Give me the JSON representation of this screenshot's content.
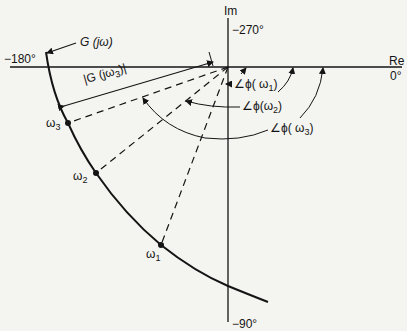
{
  "diagram": {
    "type": "polar-plot",
    "axes": {
      "imag_label": "Im",
      "real_label": "Re",
      "angle_top": "−270°",
      "angle_left": "−180°",
      "angle_right": "0°",
      "angle_bottom": "−90°"
    },
    "curve_label": "G (jω)",
    "magnitude_label": "|G (jω",
    "magnitude_sub": "3",
    "magnitude_tail": ")|",
    "points": [
      {
        "label": "ω",
        "sub": "1"
      },
      {
        "label": "ω",
        "sub": "2"
      },
      {
        "label": "ω",
        "sub": "3"
      }
    ],
    "phase_labels": [
      {
        "prefix": "∠ϕ( ω",
        "sub": "1",
        "suffix": ")"
      },
      {
        "prefix": "∠ϕ(ω",
        "sub": "2",
        "suffix": ")"
      },
      {
        "prefix": "∠ϕ( ω",
        "sub": "3",
        "suffix": ")"
      }
    ],
    "colors": {
      "ink": "#141414",
      "paper": "#f4f4f1"
    }
  }
}
